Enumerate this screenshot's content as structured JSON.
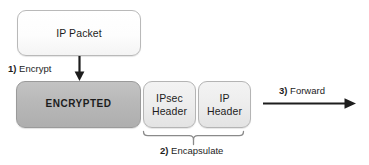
{
  "diagram": {
    "nodes": {
      "ip_packet": {
        "label": "IP Packet",
        "fill": "#ffffff",
        "border": "#b9b9b9"
      },
      "encrypted": {
        "label": "ENCRYPTED",
        "fill": "#b8b8b8",
        "border": "#9a9a9a"
      },
      "ipsec_header": {
        "label": "IPsec\nHeader",
        "line1": "IPsec",
        "line2": "Header",
        "fill": "#ededed",
        "border": "#b4b4b4"
      },
      "ip_header": {
        "label": "IP\nHeader",
        "line1": "IP",
        "line2": "Header",
        "fill": "#ededed",
        "border": "#b4b4b4"
      }
    },
    "steps": [
      {
        "id": "step-1",
        "number": "1)",
        "text": "Encrypt",
        "connector": "down-arrow"
      },
      {
        "id": "step-2",
        "number": "2)",
        "text": "Encapsulate",
        "connector": "curly-brace"
      },
      {
        "id": "step-3",
        "number": "3)",
        "text": "Forward",
        "connector": "right-arrow"
      }
    ],
    "connectors": {
      "encrypt_arrow": {
        "name": "down-arrow-icon",
        "color": "#1d1d1d"
      },
      "encapsulate_brace": {
        "name": "curly-brace-icon",
        "color": "#6a6a6a"
      },
      "forward_arrow": {
        "name": "right-arrow-icon",
        "color": "#1d1d1d"
      }
    },
    "colors": {
      "background": "#ffffff",
      "text": "#1d1d1d",
      "stroke": "#1d1d1d"
    }
  }
}
